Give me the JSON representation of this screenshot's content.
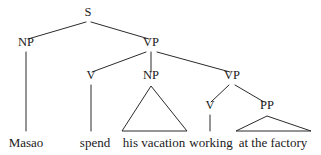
{
  "figure": {
    "type": "constituency-syntax-tree",
    "background_color": "#ffffff",
    "line_color": "#2b2b2b",
    "text_color": "#1a1a1a",
    "sentence": "Masao spend his vacation working at the factory"
  },
  "nodes": {
    "s": {
      "label": "S",
      "x": 88,
      "y": 16
    },
    "np_subject": {
      "label": "NP",
      "x": 26,
      "y": 46
    },
    "vp_main": {
      "label": "VP",
      "x": 151,
      "y": 46
    },
    "v_spend": {
      "label": "V",
      "x": 91,
      "y": 79
    },
    "np_object": {
      "label": "NP",
      "x": 151,
      "y": 79
    },
    "vp_embedded": {
      "label": "VP",
      "x": 232,
      "y": 79
    },
    "v_working": {
      "label": "V",
      "x": 210,
      "y": 109
    },
    "pp": {
      "label": "PP",
      "x": 267,
      "y": 109
    }
  },
  "leaves": [
    {
      "id": "leaf-masao",
      "label": "Masao",
      "x": 26,
      "y": 147
    },
    {
      "id": "leaf-spend",
      "label": "spend",
      "x": 95,
      "y": 147
    },
    {
      "id": "leaf-his-vacation",
      "label": "his vacation",
      "x": 154,
      "y": 147
    },
    {
      "id": "leaf-working",
      "label": "working",
      "x": 211,
      "y": 147
    },
    {
      "id": "leaf-at-the-factory",
      "label": "at the factory",
      "x": 273,
      "y": 147
    }
  ],
  "edges": [
    {
      "id": "edge-s-np",
      "from": "S",
      "to": "NP",
      "x1": 86,
      "y1": 22,
      "x2": 28,
      "y2": 39
    },
    {
      "id": "edge-s-vp",
      "from": "S",
      "to": "VP",
      "x1": 91,
      "y1": 22,
      "x2": 149,
      "y2": 39
    },
    {
      "id": "edge-np-masao",
      "from": "NP",
      "to": "Masao",
      "x1": 26,
      "y1": 52,
      "x2": 26,
      "y2": 131
    },
    {
      "id": "edge-vp-v",
      "from": "VP",
      "to": "V",
      "x1": 146,
      "y1": 52,
      "x2": 92,
      "y2": 72
    },
    {
      "id": "edge-vp-np",
      "from": "VP",
      "to": "NP",
      "x1": 151,
      "y1": 52,
      "x2": 151,
      "y2": 72
    },
    {
      "id": "edge-vp-vp",
      "from": "VP",
      "to": "VP",
      "x1": 157,
      "y1": 52,
      "x2": 230,
      "y2": 72
    },
    {
      "id": "edge-v-spend",
      "from": "V",
      "to": "spend",
      "x1": 91,
      "y1": 85,
      "x2": 91,
      "y2": 131
    },
    {
      "id": "edge-vpe-v",
      "from": "VP",
      "to": "V",
      "x1": 229,
      "y1": 85,
      "x2": 211,
      "y2": 102
    },
    {
      "id": "edge-vpe-pp",
      "from": "VP",
      "to": "PP",
      "x1": 235,
      "y1": 85,
      "x2": 264,
      "y2": 102
    },
    {
      "id": "edge-v-working",
      "from": "V",
      "to": "working",
      "x1": 210,
      "y1": 115,
      "x2": 210,
      "y2": 131
    }
  ],
  "triangles": [
    {
      "id": "triangle-np-his-vacation",
      "covers": "his vacation",
      "apex_x": 151,
      "apex_y": 86,
      "left_x": 122,
      "right_x": 187,
      "base_y": 131
    },
    {
      "id": "triangle-pp-at-the-factory",
      "covers": "at the factory",
      "apex_x": 267,
      "apex_y": 116,
      "left_x": 236,
      "right_x": 311,
      "base_y": 131
    }
  ]
}
